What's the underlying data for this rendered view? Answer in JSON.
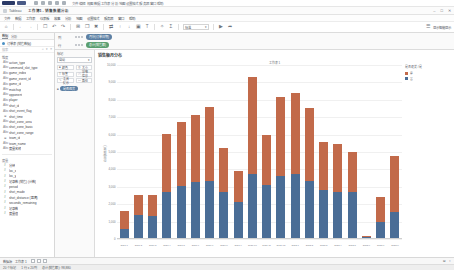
{
  "os_bar": {
    "app_badge": "badge",
    "hint_text": "文件  编辑  视图  数据  工作表  分析  地图  设置格式  服务器  窗口  帮助"
  },
  "window": {
    "tab_label": "Tableau",
    "document_title": "工作簿1 - 销售数据分析",
    "controls": {
      "minimize": "–",
      "maximize": "□",
      "close": "✕"
    }
  },
  "menubar": {
    "items": [
      "文件",
      "数据",
      "工作表",
      "仪表板",
      "故事",
      "分析",
      "地图",
      "设置格式",
      "服务器",
      "窗口",
      "帮助"
    ]
  },
  "toolbar": {
    "buttons": [
      {
        "name": "tableau-home-icon",
        "glyph": "⌂"
      },
      {
        "name": "back-icon",
        "glyph": "←"
      },
      {
        "name": "forward-icon",
        "glyph": "→"
      },
      {
        "name": "save-icon",
        "glyph": "὚B"
      },
      {
        "name": "undo-icon",
        "glyph": "↶"
      },
      {
        "name": "redo-icon",
        "glyph": "↷"
      },
      {
        "name": "new-worksheet-icon",
        "glyph": "⊞"
      },
      {
        "name": "duplicate-sheet-icon",
        "glyph": "❐"
      },
      {
        "name": "clear-sheet-icon",
        "glyph": "✖"
      },
      {
        "name": "swap-rows-columns-icon",
        "glyph": "⇄"
      },
      {
        "name": "sort-ascending-icon",
        "glyph": "↑"
      },
      {
        "name": "sort-descending-icon",
        "glyph": "↓"
      },
      {
        "name": "group-icon",
        "glyph": "▣"
      },
      {
        "name": "labels-icon",
        "glyph": "T"
      },
      {
        "name": "highlight-icon",
        "glyph": "✧"
      },
      {
        "name": "totals-icon",
        "glyph": "Σ"
      }
    ],
    "fit_select": {
      "value": "标准",
      "chevron": "▾"
    },
    "presentation_icon": "▶",
    "share_icon": "➦",
    "right_label": "显示智能显示"
  },
  "data_pane": {
    "tabs": [
      {
        "label": "数据",
        "active": true
      },
      {
        "label": "分析",
        "active": false
      }
    ],
    "source": {
      "icon": "database-icon",
      "label": "订单表 (销售数据)"
    },
    "search": {
      "placeholder": "搜索",
      "icons": [
        "⌕",
        "▾",
        "≡"
      ]
    },
    "dimensions_label": "维度",
    "dimensions": [
      {
        "icon": "Abc",
        "name": "action_type"
      },
      {
        "icon": "Abc",
        "name": "command_slot_type"
      },
      {
        "icon": "Abc",
        "name": "game_index"
      },
      {
        "icon": "Abc",
        "name": "game_event_id"
      },
      {
        "icon": "Abc",
        "name": "game_id"
      },
      {
        "icon": "Abc",
        "name": "matchup"
      },
      {
        "icon": "Abc",
        "name": "opponent"
      },
      {
        "icon": "Abc",
        "name": "player"
      },
      {
        "icon": "Abc",
        "name": "shot_id"
      },
      {
        "icon": "Abc",
        "name": "shot_event_flag"
      },
      {
        "icon": "⊕",
        "name": "shot_time"
      },
      {
        "icon": "Abc",
        "name": "shot_zone_area"
      },
      {
        "icon": "Abc",
        "name": "shot_zone_basic"
      },
      {
        "icon": "Abc",
        "name": "shot_zone_range"
      },
      {
        "icon": "⊕",
        "name": "team_id"
      },
      {
        "icon": "Abc",
        "name": "team_name"
      },
      {
        "icon": "Abc",
        "name": "度量名称"
      }
    ],
    "measures_label": "度量",
    "measures": [
      {
        "icon": "#",
        "name": "分钟"
      },
      {
        "icon": "#",
        "name": "loc_x"
      },
      {
        "icon": "#",
        "name": "loc_y"
      },
      {
        "icon": "#",
        "name": "记录数 (销售) (计数)"
      },
      {
        "icon": "#",
        "name": "period"
      },
      {
        "icon": "#",
        "name": "shot_made"
      },
      {
        "icon": "#",
        "name": "shot_distance (距离)"
      },
      {
        "icon": "#",
        "name": "seconds_remaining"
      },
      {
        "icon": "#",
        "name": "记录数"
      },
      {
        "icon": "#",
        "name": "度量值"
      }
    ]
  },
  "shelves": {
    "columns": {
      "label": "列",
      "pill": "月份(订单日期)"
    },
    "rows": {
      "label": "行",
      "pill": "总计(销售额)"
    }
  },
  "marks": {
    "title": "标记",
    "type_select": {
      "value": "自动",
      "chevron": "▾"
    },
    "props": [
      {
        "icon": "■",
        "label": "颜色"
      },
      {
        "icon": "◎",
        "label": "大小"
      },
      {
        "icon": "T",
        "label": "标签"
      },
      {
        "icon": "ⓘ",
        "label": "详细信息"
      },
      {
        "icon": "ὊC",
        "label": "工具提示"
      },
      {
        "icon": "▭",
        "label": "路径"
      }
    ],
    "shelf_pill": {
      "icon": "■",
      "label": "是否退货"
    }
  },
  "chart": {
    "title": "销售额月分布",
    "subtitle": "工作表 1",
    "legend": {
      "title": "是否退货 / 是",
      "entries": [
        {
          "label": "是",
          "color": "#c26a4a"
        },
        {
          "label": "否",
          "color": "#4a6d96"
        }
      ]
    }
  },
  "chart_data": {
    "type": "bar",
    "stacked": true,
    "title": "销售额月分布",
    "subtitle": "工作表 1",
    "xlabel": "",
    "ylabel": "总计(销售额)",
    "ylim": [
      0,
      10000
    ],
    "grid": true,
    "legend_position": "right",
    "yticks": [
      0,
      1000,
      2000,
      3000,
      4000,
      5000,
      6000,
      7000,
      8000,
      9000,
      10000
    ],
    "ytick_labels": [
      "0",
      "1,000",
      "2,000",
      "3,000",
      "4,000",
      "5,000",
      "6,000",
      "7,000",
      "8,000",
      "9,000",
      "10,000"
    ],
    "categories": [
      "2021-1",
      "2021-2",
      "2021-3",
      "2021-4",
      "2021-5",
      "2021-6",
      "2021-7",
      "2021-8",
      "2021-9",
      "2021-10",
      "2021-11",
      "2021-12",
      "2022-1",
      "2022-2",
      "2022-3",
      "2022-4",
      "2022-5",
      "2022-6",
      "2022-7",
      "2022-8"
    ],
    "series": [
      {
        "name": "否",
        "color": "#4a6d96",
        "values": [
          580,
          1380,
          1340,
          2730,
          3050,
          3260,
          3330,
          2730,
          2120,
          3730,
          3090,
          3600,
          3730,
          3330,
          2820,
          2700,
          2680,
          140,
          1000,
          1550
        ]
      },
      {
        "name": "是",
        "color": "#c26a4a",
        "values": [
          1020,
          1160,
          1180,
          3300,
          3700,
          3840,
          4260,
          2480,
          1800,
          5570,
          2900,
          4570,
          4640,
          4180,
          2730,
          2750,
          2300,
          30,
          1400,
          3200
        ]
      }
    ],
    "totals": [
      1600,
      2540,
      2520,
      6030,
      6750,
      7100,
      7590,
      5210,
      3920,
      9300,
      5990,
      8170,
      8370,
      7510,
      5550,
      5450,
      4980,
      170,
      2400,
      4750
    ]
  },
  "status_bar": {
    "tabs": [
      "数据源",
      "工作表 1"
    ],
    "sheet_icons": [
      "new-worksheet-icon",
      "new-dashboard-icon",
      "new-story-icon"
    ],
    "right_items": [
      "⊟",
      "⌖"
    ]
  },
  "info_bar": {
    "items": [
      "20 个标记",
      "1 行 x 20 列",
      "总计(销售额): 98,880"
    ]
  }
}
